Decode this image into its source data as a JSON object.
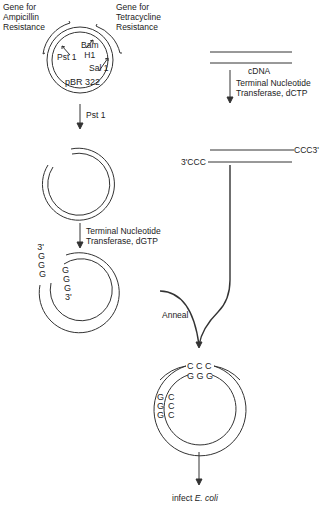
{
  "diagram": {
    "title": "",
    "colors": {
      "line": "#333333",
      "text": "#222222",
      "background": "#ffffff"
    },
    "plasmid": {
      "gene_amp": [
        "Gene for",
        "Ampicillin",
        "Resistance"
      ],
      "gene_tet": [
        "Gene for",
        "Tetracycline",
        "Resistance"
      ],
      "site_pst": "Pst 1",
      "site_bam": [
        "Bam",
        "H1"
      ],
      "site_sal": "Sal 1",
      "name": "pBR 322"
    },
    "left_path": {
      "step1": "Pst 1",
      "step2": [
        "Terminal Nucleotide",
        "Transferase, dGTP"
      ],
      "tail_outer": [
        "3'",
        "G",
        "G",
        "G"
      ],
      "tail_inner": [
        "G",
        "G",
        "G",
        "3'"
      ]
    },
    "right_path": {
      "cdna_label": "cDNA",
      "step": [
        "Terminal Nucleotide",
        "Transferase, dCTP"
      ],
      "end_top": "CCC3'",
      "end_bottom": "3'CCC"
    },
    "anneal_label": "Anneal",
    "product": {
      "top_outer": "C C C",
      "top_inner": "G G G",
      "left_outer": [
        "G",
        "G",
        "G"
      ],
      "left_inner": [
        "C",
        "C",
        "C"
      ]
    },
    "final_step": {
      "prefix": "infect ",
      "organism": "E. coli"
    }
  }
}
